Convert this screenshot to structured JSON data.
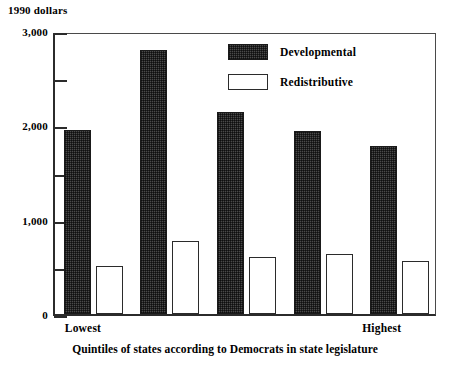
{
  "chart_data": {
    "type": "bar",
    "title": "",
    "subtitle": "",
    "ylabel": "1990 dollars",
    "xlabel": "Quintiles of states according to Democrats in state legislature",
    "categories": [
      "Lowest",
      "2",
      "3",
      "4",
      "Highest"
    ],
    "visible_category_labels": {
      "first": "Lowest",
      "last": "Highest"
    },
    "series": [
      {
        "name": "Developmental",
        "color": "#4a4a4a",
        "fill": "dark-hatched",
        "values": [
          1950,
          2800,
          2140,
          1940,
          1780
        ]
      },
      {
        "name": "Redistributive",
        "color": "#ffffff",
        "fill": "white-outlined",
        "values": [
          510,
          775,
          600,
          640,
          560
        ]
      }
    ],
    "ylim": [
      0,
      3000
    ],
    "y_major_ticks": [
      0,
      1000,
      2000,
      3000
    ],
    "y_major_tick_labels": [
      "0",
      "1,000",
      "2,000",
      "3,000"
    ],
    "y_minor_ticks": [
      500,
      1500,
      2500
    ],
    "grid": false,
    "legend_position": "top-center-right",
    "legend_entries": [
      "Developmental",
      "Redistributive"
    ]
  },
  "axis": {
    "y_unit_caption": "1990 dollars"
  }
}
